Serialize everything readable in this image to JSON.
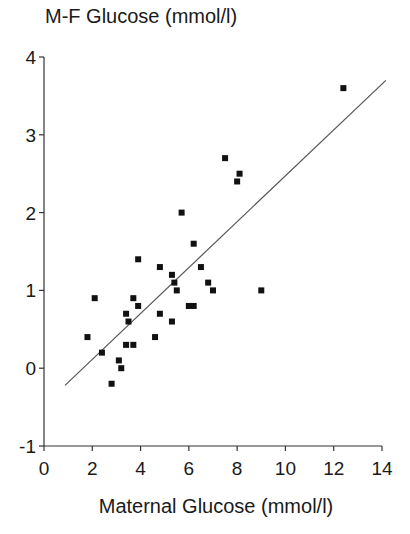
{
  "chart_data": {
    "type": "scatter",
    "title": "",
    "xlabel": "Maternal Glucose (mmol/l)",
    "ylabel": "M-F Glucose (mmol/l)",
    "xlim": [
      0,
      14
    ],
    "ylim": [
      -1,
      4
    ],
    "xticks": [
      0,
      2,
      4,
      6,
      8,
      10,
      12,
      14
    ],
    "yticks": [
      -1,
      0,
      1,
      2,
      3,
      4
    ],
    "grid": false,
    "legend": null,
    "series": [
      {
        "name": "observations",
        "marker": "square",
        "color": "#111111",
        "points": [
          [
            1.8,
            0.4
          ],
          [
            2.1,
            0.9
          ],
          [
            2.4,
            0.2
          ],
          [
            2.8,
            -0.2
          ],
          [
            3.1,
            0.1
          ],
          [
            3.2,
            0.0
          ],
          [
            3.4,
            0.3
          ],
          [
            3.4,
            0.7
          ],
          [
            3.5,
            0.6
          ],
          [
            3.7,
            0.9
          ],
          [
            3.7,
            0.3
          ],
          [
            3.9,
            0.8
          ],
          [
            3.9,
            1.4
          ],
          [
            4.6,
            0.4
          ],
          [
            4.8,
            1.3
          ],
          [
            4.8,
            0.7
          ],
          [
            5.3,
            1.2
          ],
          [
            5.3,
            0.6
          ],
          [
            5.4,
            1.1
          ],
          [
            5.5,
            1.0
          ],
          [
            5.7,
            2.0
          ],
          [
            6.0,
            0.8
          ],
          [
            6.2,
            0.8
          ],
          [
            6.2,
            1.6
          ],
          [
            6.5,
            1.3
          ],
          [
            6.8,
            1.1
          ],
          [
            7.0,
            1.0
          ],
          [
            7.5,
            2.7
          ],
          [
            8.0,
            2.4
          ],
          [
            8.1,
            2.5
          ],
          [
            9.0,
            1.0
          ],
          [
            12.4,
            3.6
          ]
        ]
      }
    ],
    "regression_line": {
      "start": [
        0.87,
        -0.22
      ],
      "end": [
        14.16,
        3.7
      ],
      "color": "#555555"
    }
  }
}
